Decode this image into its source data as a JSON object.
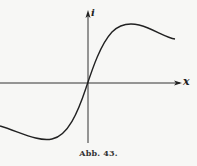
{
  "figure": {
    "caption": "Abb. 43.",
    "x_axis_label": "x",
    "y_axis_label": "i"
  },
  "colors": {
    "background": "#f7f7f5",
    "ink": "#222222"
  }
}
